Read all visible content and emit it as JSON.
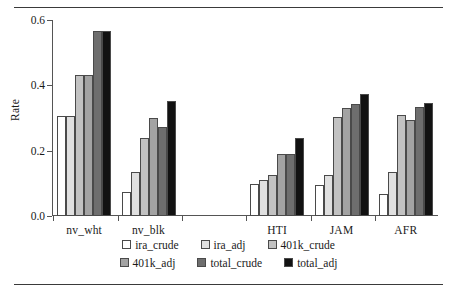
{
  "figure": {
    "ylabel": "Rate",
    "ytick_labels": [
      "0.0",
      "0.2",
      "0.4",
      "0.6"
    ]
  },
  "chart_data": {
    "type": "bar",
    "title": "",
    "xlabel": "",
    "ylabel": "Rate",
    "ylim": [
      0.0,
      0.6
    ],
    "yticks": [
      0.0,
      0.2,
      0.4,
      0.6
    ],
    "grid": false,
    "legend_position": "bottom",
    "categories": [
      "nv_wht",
      "nv_blk",
      "",
      "HTI",
      "JAM",
      "AFR"
    ],
    "series": [
      {
        "name": "ira_crude",
        "color": "#ffffff",
        "values": [
          0.305,
          0.073,
          null,
          0.098,
          0.095,
          0.068
        ]
      },
      {
        "name": "ira_adj",
        "color": "#e0e0e0",
        "values": [
          0.305,
          0.135,
          null,
          0.11,
          0.125,
          0.135
        ]
      },
      {
        "name": "401k_crude",
        "color": "#c2c2c2",
        "values": [
          0.433,
          0.24,
          null,
          0.127,
          0.302,
          0.308
        ]
      },
      {
        "name": "401k_adj",
        "color": "#a3a3a3",
        "values": [
          0.433,
          0.3,
          null,
          0.19,
          0.33,
          0.294
        ]
      },
      {
        "name": "total_crude",
        "color": "#6e6e6e",
        "values": [
          0.565,
          0.272,
          null,
          0.19,
          0.342,
          0.335
        ]
      },
      {
        "name": "total_adj",
        "color": "#121212",
        "values": [
          0.565,
          0.352,
          null,
          0.24,
          0.375,
          0.345
        ]
      }
    ]
  },
  "legend": {
    "rows": [
      [
        {
          "label": "ira_crude",
          "color": "#ffffff"
        },
        {
          "label": "ira_adj",
          "color": "#e0e0e0"
        },
        {
          "label": "401k_crude",
          "color": "#c2c2c2"
        }
      ],
      [
        {
          "label": "401k_adj",
          "color": "#a3a3a3"
        },
        {
          "label": "total_crude",
          "color": "#6e6e6e"
        },
        {
          "label": "total_adj",
          "color": "#121212"
        }
      ]
    ]
  }
}
